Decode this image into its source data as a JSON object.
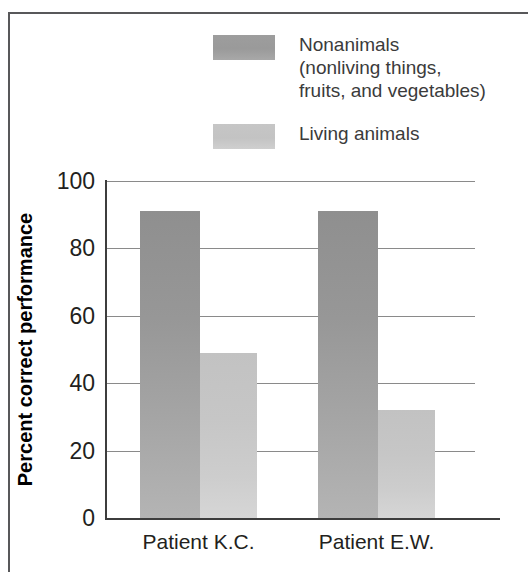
{
  "chart_data": {
    "type": "bar",
    "title": "",
    "xlabel": "",
    "ylabel": "Percent correct performance",
    "categories": [
      "Patient K.C.",
      "Patient E.W."
    ],
    "series": [
      {
        "name": "Nonanimals\n(nonliving things,\nfruits, and vegetables)",
        "short_name": "Nonanimals",
        "color": "#9a9a9a",
        "values": [
          91,
          91
        ]
      },
      {
        "name": "Living animals",
        "short_name": "Living animals",
        "color": "#c6c6c6",
        "values": [
          49,
          32
        ]
      }
    ],
    "ylim": [
      0,
      100
    ],
    "yticks": [
      0,
      20,
      40,
      60,
      80,
      100
    ],
    "ytick_labels": [
      "0",
      "20",
      "40",
      "60",
      "80",
      "100"
    ],
    "grid": true,
    "grid_axis": "y",
    "legend_position": "top-center",
    "bar_group_style": "adjacent-pairs"
  },
  "legend": [
    {
      "id": "nonanimals",
      "label": "Nonanimals\n(nonliving things,\nfruits, and vegetables)",
      "swatch_color": "#9a9a9a"
    },
    {
      "id": "living-animals",
      "label": "Living animals",
      "swatch_color": "#c6c6c6"
    }
  ],
  "axes": {
    "y_title": "Percent correct performance",
    "y_ticks": [
      "100",
      "80",
      "60",
      "40",
      "20",
      "0"
    ],
    "x_ticks": [
      "Patient K.C.",
      "Patient E.W."
    ]
  },
  "colors": {
    "frame": "#58585a",
    "axis": "#3d3d3d",
    "gridline": "#8a8a8a",
    "text": "#231f20",
    "background": "#ffffff"
  }
}
